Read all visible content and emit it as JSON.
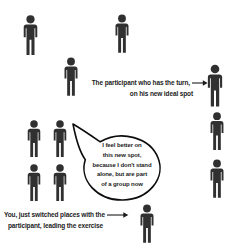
{
  "colors": {
    "icon": "#303030",
    "text": "#1c1c1c",
    "bubble_stroke": "#0d0d0d",
    "bubble_fill": "#ffffff",
    "background": "#ffffff"
  },
  "annotations": {
    "turn": {
      "line1": "The participant who has the turn,",
      "line2": "on his new ideal spot"
    },
    "you": {
      "line1": "You, just switched places with the",
      "line2": "participant, leading the exercise"
    }
  },
  "speech_bubble": {
    "lines": [
      "I feel better on",
      "this new spot,",
      "because I don't stand",
      "alone, but are part",
      "of a group now"
    ]
  },
  "icons": {
    "person": "standing-person-silhouette",
    "arrow": "long-right-arrow"
  },
  "people": [
    {
      "name": "top-left",
      "x": 20,
      "y": 15,
      "w": 21,
      "h": 40
    },
    {
      "name": "top-second",
      "x": 61,
      "y": 57,
      "w": 20,
      "h": 39
    },
    {
      "name": "top-center",
      "x": 112,
      "y": 14,
      "w": 20,
      "h": 39
    },
    {
      "name": "turn-target",
      "x": 204,
      "y": 64,
      "w": 22,
      "h": 43
    },
    {
      "name": "group-1",
      "x": 24,
      "y": 120,
      "w": 20,
      "h": 37
    },
    {
      "name": "group-2",
      "x": 50,
      "y": 120,
      "w": 20,
      "h": 37
    },
    {
      "name": "group-3",
      "x": 24,
      "y": 164,
      "w": 20,
      "h": 37
    },
    {
      "name": "group-4",
      "x": 50,
      "y": 164,
      "w": 20,
      "h": 37
    },
    {
      "name": "right-1",
      "x": 207,
      "y": 112,
      "w": 20,
      "h": 38
    },
    {
      "name": "right-2",
      "x": 207,
      "y": 159,
      "w": 20,
      "h": 39
    },
    {
      "name": "you",
      "x": 137,
      "y": 204,
      "w": 20,
      "h": 39
    }
  ]
}
